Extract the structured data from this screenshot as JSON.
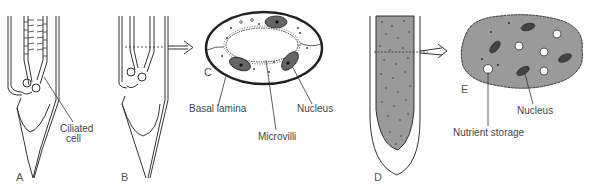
{
  "panels": [
    {
      "id": "A",
      "letter": "A"
    },
    {
      "id": "B",
      "letter": "B"
    },
    {
      "id": "C",
      "letter": "C"
    },
    {
      "id": "D",
      "letter": "D"
    },
    {
      "id": "E",
      "letter": "E"
    }
  ],
  "labels": {
    "ciliated_cell_line1": "Ciliated",
    "ciliated_cell_line2": "cell",
    "basal_lamina": "Basal lamina",
    "microvilli": "Microvilli",
    "nucleus_c": "Nucleus",
    "nucleus_e": "Nucleus",
    "nutrient_storage": "Nutrient storage"
  },
  "colors": {
    "line": "#333333",
    "shaded": "#9a9a9a",
    "dark": "#555555",
    "background": "#ffffff"
  }
}
